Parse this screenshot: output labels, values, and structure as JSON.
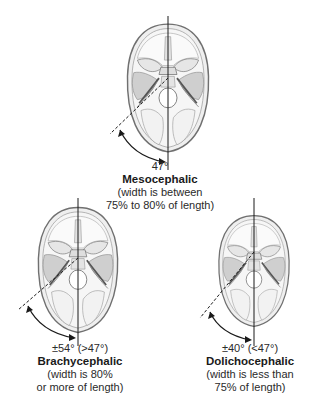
{
  "diagram": {
    "type": "cephalic-index-skull-shapes",
    "colors": {
      "outline": "#6f6f6f",
      "fill": "#ececec",
      "inner": "#d6d6d6",
      "shade": "#bdbdbd",
      "line": "#1a1a1a",
      "text": "#222222"
    },
    "skulls": [
      {
        "id": "mesocephalic",
        "angle": "47°",
        "name": "Mesocephalic",
        "desc_line1": "(width is between",
        "desc_line2": "75% to 80% of length)"
      },
      {
        "id": "brachycephalic",
        "angle": "±54° (>47°)",
        "name": "Brachycephalic",
        "desc_line1": "(width is 80%",
        "desc_line2": "or more of length)"
      },
      {
        "id": "dolichocephalic",
        "angle": "±40° (<47°)",
        "name": "Dolichocephalic",
        "desc_line1": "(width is less than",
        "desc_line2": "75% of length)"
      }
    ]
  }
}
